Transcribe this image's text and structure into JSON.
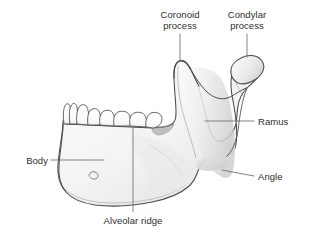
{
  "figure": {
    "background_color": "#ffffff",
    "outline_color": "#4a4a4a",
    "bone_fill_color": "#f2f2f2",
    "shade_color": "#d9d9d9",
    "label_color": "#2e2e2e",
    "leader_color": "#7a7a7a"
  },
  "labels": {
    "coronoid_process": "Coronoid\nprocess",
    "coronoid_process_line1": "Coronoid",
    "coronoid_process_line2": "process",
    "condylar_process_line1": "Condylar",
    "condylar_process_line2": "process",
    "ramus": "Ramus",
    "angle": "Angle",
    "body": "Body",
    "alveolar_ridge": "Alveolar ridge"
  },
  "structures": [
    {
      "name": "coronoid-process",
      "label": "Coronoid process"
    },
    {
      "name": "condylar-process",
      "label": "Condylar process"
    },
    {
      "name": "ramus",
      "label": "Ramus"
    },
    {
      "name": "angle",
      "label": "Angle"
    },
    {
      "name": "body",
      "label": "Body"
    },
    {
      "name": "alveolar-ridge",
      "label": "Alveolar ridge"
    },
    {
      "name": "teeth",
      "label": "Teeth"
    },
    {
      "name": "mental-foramen",
      "label": "Mental foramen"
    },
    {
      "name": "mandibular-notch",
      "label": "Mandibular notch"
    }
  ],
  "tooth_count": 8
}
